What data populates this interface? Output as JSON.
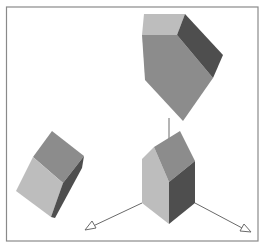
{
  "figure": {
    "colors": {
      "background": "#ffffff",
      "frame": "#8a8a8a",
      "light_face": "#bdbdbd",
      "mid_face": "#8c8c8c",
      "dark_face": "#4e4e4e",
      "axis_line": "#6a6a6a"
    },
    "objects": [
      {
        "name": "top-polyhedron",
        "position": "upper-right"
      },
      {
        "name": "bottom-polyhedron",
        "position": "lower-right, at axes origin"
      },
      {
        "name": "left-cube",
        "position": "lower-left"
      }
    ],
    "axes": [
      {
        "name": "left-axis",
        "direction": "down-left"
      },
      {
        "name": "right-axis",
        "direction": "down-right"
      },
      {
        "name": "vertical-axis",
        "direction": "up"
      }
    ]
  }
}
